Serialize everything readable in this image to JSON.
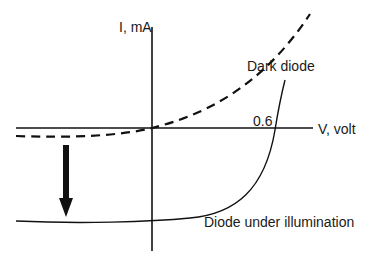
{
  "diagram": {
    "y_axis_label": "I, mA",
    "x_axis_label": "V, volt",
    "tick_label": "0.6",
    "curves": [
      {
        "name": "Dark diode",
        "style": "dashed"
      },
      {
        "name": "Diode under illumination",
        "style": "solid"
      }
    ],
    "arrow": {
      "direction": "down",
      "meaning": "photocurrent shift"
    }
  }
}
